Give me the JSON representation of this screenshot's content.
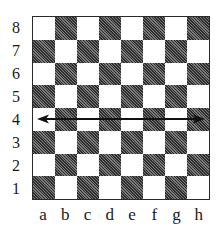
{
  "diagram": {
    "type": "chessboard",
    "size": 8,
    "bottom_left_square_color": "dark",
    "ranks": [
      "8",
      "7",
      "6",
      "5",
      "4",
      "3",
      "2",
      "1"
    ],
    "files": [
      "a",
      "b",
      "c",
      "d",
      "e",
      "f",
      "g",
      "h"
    ],
    "arrow": {
      "rank": "4",
      "from_file": "a",
      "to_file": "h",
      "bidirectional": true,
      "description": "Double-headed horizontal arrow across rank 4"
    },
    "colors": {
      "light_square": "#ffffff",
      "dark_square": "#555555",
      "border": "#2a2a2a",
      "arrow": "#111111",
      "label_text": "#1a1a1a"
    }
  }
}
